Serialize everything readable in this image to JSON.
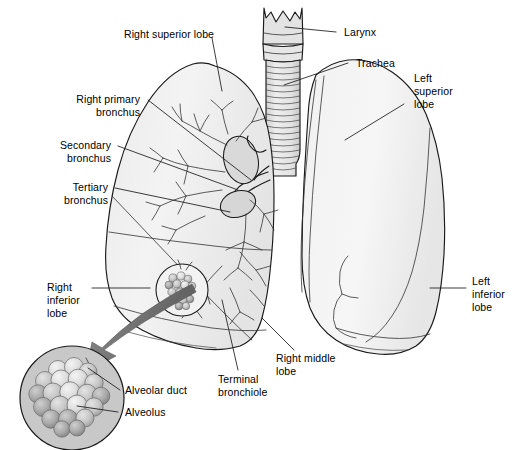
{
  "figure": {
    "background_color": "#ffffff",
    "outline_color": "#1a1a1a",
    "lung_fill_color": "#f0f0f0",
    "lung_shade_color": "#e0e0e0",
    "bronchus_fill_color": "#d9d9d9",
    "alveoli_circle_fill": "#c8c8c8",
    "alveolus_light": "#e8e8e8",
    "alveolus_mid": "#bfbfbf",
    "alveolus_dark": "#9a9a9a",
    "arrow_color": "#6b6b6b"
  },
  "labels": {
    "right_superior_lobe": "Right superior lobe",
    "right_primary_bronchus_l1": "Right primary",
    "right_primary_bronchus_l2": "bronchus",
    "secondary_bronchus_l1": "Secondary",
    "secondary_bronchus_l2": "bronchus",
    "tertiary_bronchus_l1": "Tertiary",
    "tertiary_bronchus_l2": "bronchus",
    "right_inferior_lobe_l1": "Right",
    "right_inferior_lobe_l2": "inferior",
    "right_inferior_lobe_l3": "lobe",
    "alveolar_duct": "Alveolar duct",
    "alveolus": "Alveolus",
    "terminal_bronchiole_l1": "Terminal",
    "terminal_bronchiole_l2": "bronchiole",
    "right_middle_lobe_l1": "Right middle",
    "right_middle_lobe_l2": "lobe",
    "larynx": "Larynx",
    "trachea": "Trachea",
    "left_superior_lobe_l1": "Left",
    "left_superior_lobe_l2": "superior",
    "left_superior_lobe_l3": "lobe",
    "left_inferior_lobe_l1": "Left",
    "left_inferior_lobe_l2": "inferior",
    "left_inferior_lobe_l3": "lobe"
  },
  "structures": [
    {
      "name": "larynx",
      "label": "Larynx"
    },
    {
      "name": "trachea",
      "label": "Trachea"
    },
    {
      "name": "right-superior-lobe",
      "label": "Right superior lobe"
    },
    {
      "name": "right-middle-lobe",
      "label": "Right middle lobe"
    },
    {
      "name": "right-inferior-lobe",
      "label": "Right inferior lobe"
    },
    {
      "name": "left-superior-lobe",
      "label": "Left superior lobe"
    },
    {
      "name": "left-inferior-lobe",
      "label": "Left inferior lobe"
    },
    {
      "name": "right-primary-bronchus",
      "label": "Right primary bronchus"
    },
    {
      "name": "secondary-bronchus",
      "label": "Secondary bronchus"
    },
    {
      "name": "tertiary-bronchus",
      "label": "Tertiary bronchus"
    },
    {
      "name": "terminal-bronchiole",
      "label": "Terminal bronchiole"
    },
    {
      "name": "alveolar-duct",
      "label": "Alveolar duct"
    },
    {
      "name": "alveolus",
      "label": "Alveolus"
    }
  ]
}
